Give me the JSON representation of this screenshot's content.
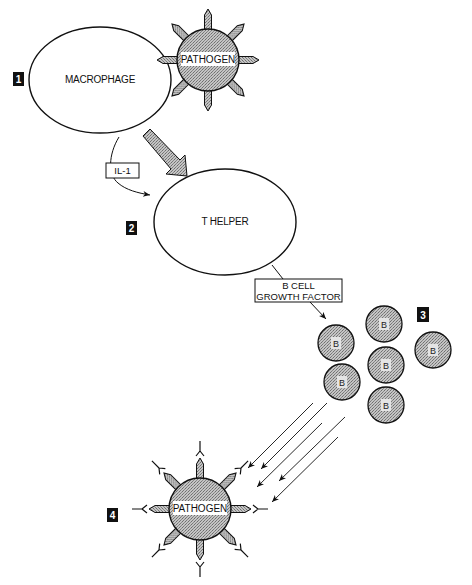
{
  "diagram": {
    "steps": [
      {
        "number": "1",
        "x": 13,
        "y": 72
      },
      {
        "number": "2",
        "x": 126,
        "y": 221
      },
      {
        "number": "3",
        "x": 417,
        "y": 307
      },
      {
        "number": "4",
        "x": 107,
        "y": 508
      }
    ],
    "cells": {
      "macrophage": {
        "label": "MACROPHAGE",
        "cx": 100,
        "cy": 80,
        "rx": 71,
        "ry": 53
      },
      "t_helper": {
        "label": "T HELPER",
        "cx": 225,
        "cy": 222,
        "rx": 71,
        "ry": 53
      },
      "pathogen_top": {
        "label": "PATHOGEN",
        "cx": 208,
        "cy": 60,
        "r": 31
      },
      "pathogen_bottom": {
        "label": "PATHOGEN",
        "cx": 200,
        "cy": 509,
        "r": 31
      },
      "b_cells": [
        {
          "label": "B",
          "cx": 336,
          "cy": 343
        },
        {
          "label": "B",
          "cx": 384,
          "cy": 324
        },
        {
          "label": "B",
          "cx": 386,
          "cy": 365
        },
        {
          "label": "B",
          "cx": 342,
          "cy": 382
        },
        {
          "label": "B",
          "cx": 386,
          "cy": 405
        },
        {
          "label": "B",
          "cx": 433,
          "cy": 350
        }
      ]
    },
    "signals": {
      "il1": {
        "label": "IL-1"
      },
      "b_cell_growth_factor": {
        "line1": "B CELL",
        "line2": "GROWTH FACTOR"
      }
    },
    "antibody_arrows": 5
  },
  "colors": {
    "outline": "#111111",
    "hatch_fill": "#b8b8b8",
    "hatch_dark": "#7a7a7a",
    "step_badge": "#111111",
    "background": "#ffffff"
  }
}
